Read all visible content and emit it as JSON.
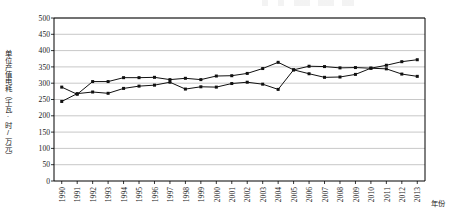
{
  "figure": {
    "background_color": "#ffffff",
    "axis_color": "#000000",
    "grid_color": "#b0b0b0",
    "series_color": "#111111"
  },
  "axis_titles": {
    "y": "单位产值电耗（千瓦·时/万元）",
    "x": "年份"
  },
  "chart_data": {
    "type": "line",
    "title": "",
    "xlabel": "年份",
    "ylabel": "单位产值电耗（千瓦·时/万元）",
    "grid": true,
    "legend": "none",
    "ylim": [
      0,
      500
    ],
    "ytick_step": 50,
    "yticks": [
      "0",
      "50",
      "100",
      "150",
      "200",
      "250",
      "300",
      "350",
      "400",
      "450",
      "500"
    ],
    "categories": [
      "1990",
      "1991",
      "1992",
      "1993",
      "1994",
      "1995",
      "1996",
      "1997",
      "1998",
      "1999",
      "2000",
      "2001",
      "2002",
      "2003",
      "2004",
      "2005",
      "2006",
      "2007",
      "2008",
      "2009",
      "2010",
      "2011",
      "2012",
      "2013"
    ],
    "series": [
      {
        "name": "series-upper",
        "values": [
          288,
          266,
          305,
          305,
          317,
          317,
          318,
          311,
          315,
          311,
          322,
          323,
          330,
          345,
          364,
          341,
          352,
          351,
          347,
          348,
          346,
          344,
          328,
          321
        ]
      },
      {
        "name": "series-lower",
        "values": [
          244,
          268,
          273,
          269,
          284,
          291,
          294,
          303,
          282,
          289,
          288,
          299,
          303,
          297,
          281,
          341,
          329,
          318,
          319,
          327,
          346,
          355,
          366,
          372
        ]
      }
    ]
  }
}
